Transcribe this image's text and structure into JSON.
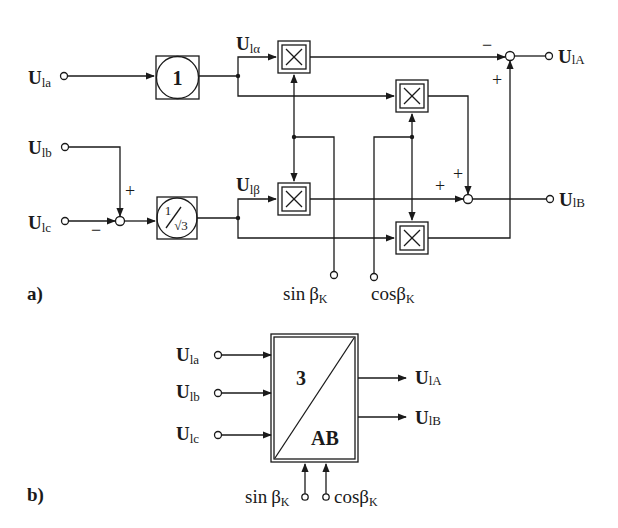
{
  "panel_a": {
    "label": "a)",
    "inputs": {
      "u_la": {
        "main": "U",
        "sub": "la"
      },
      "u_lb": {
        "main": "U",
        "sub": "lb"
      },
      "u_lc": {
        "main": "U",
        "sub": "lc"
      }
    },
    "blocks": {
      "gain_one": "1",
      "gain_inv_sqrt3_num": "1",
      "gain_inv_sqrt3_den": "√3"
    },
    "intermediate": {
      "u_lalpha": {
        "main": "U",
        "sub": "lα"
      },
      "u_lbeta": {
        "main": "U",
        "sub": "lβ"
      }
    },
    "multiplier_symbol": "×",
    "signs": {
      "sum_in_lb": "+",
      "sum_in_lc": "−",
      "sum_A_top": "−",
      "sum_A_bottom": "+",
      "sum_B_left": "+",
      "sum_B_top": "+"
    },
    "outputs": {
      "u_1A": {
        "main": "U",
        "sub": "lA"
      },
      "u_1B": {
        "main": "U",
        "sub": "lB"
      }
    },
    "angle_inputs": {
      "sin": {
        "func": "sin",
        "var": "β",
        "sub": "K"
      },
      "cos": {
        "func": "cos",
        "var": "β",
        "sub": "K"
      }
    }
  },
  "panel_b": {
    "label": "b)",
    "inputs": {
      "u_la": {
        "main": "U",
        "sub": "la"
      },
      "u_lb": {
        "main": "U",
        "sub": "lb"
      },
      "u_lc": {
        "main": "U",
        "sub": "lc"
      }
    },
    "block_top": "3",
    "block_bottom": "AB",
    "outputs": {
      "u_1A": {
        "main": "U",
        "sub": "lA"
      },
      "u_1B": {
        "main": "U",
        "sub": "lB"
      }
    },
    "angle_inputs": {
      "sin": {
        "func": "sin",
        "var": "β",
        "sub": "K"
      },
      "cos": {
        "func": "cos",
        "var": "β",
        "sub": "K"
      }
    }
  }
}
